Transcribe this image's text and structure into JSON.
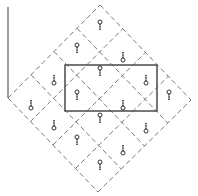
{
  "diagram": {
    "width": 198,
    "height": 196,
    "colors": {
      "background": "#ffffff",
      "dashed_grid": "#7a7a7a",
      "solid_rect": "#4a4a4a",
      "axis_line": "#6a6a6a",
      "symbol": "#333333"
    },
    "axis_line": {
      "x": 8,
      "y1": 7,
      "y2": 98
    },
    "diamond": {
      "top": [
        100,
        5
      ],
      "right": [
        191,
        100
      ],
      "bottom": [
        98,
        192
      ],
      "left": [
        8,
        98
      ],
      "divisions": 4
    },
    "rectangle": {
      "x": 65,
      "y": 65,
      "width": 92,
      "height": 46
    },
    "symbols": [
      {
        "x": 100,
        "y": 25,
        "type": "circle-top"
      },
      {
        "x": 77,
        "y": 48,
        "type": "circle-top"
      },
      {
        "x": 123,
        "y": 57,
        "type": "circle-bottom"
      },
      {
        "x": 54,
        "y": 80,
        "type": "circle-bottom"
      },
      {
        "x": 100,
        "y": 71,
        "type": "circle-top"
      },
      {
        "x": 146,
        "y": 80,
        "type": "circle-bottom"
      },
      {
        "x": 31,
        "y": 105,
        "type": "circle-bottom"
      },
      {
        "x": 77,
        "y": 95,
        "type": "circle-top"
      },
      {
        "x": 123,
        "y": 105,
        "type": "circle-bottom"
      },
      {
        "x": 169,
        "y": 95,
        "type": "circle-top"
      },
      {
        "x": 54,
        "y": 125,
        "type": "circle-bottom"
      },
      {
        "x": 100,
        "y": 118,
        "type": "circle-top"
      },
      {
        "x": 146,
        "y": 128,
        "type": "circle-bottom"
      },
      {
        "x": 77,
        "y": 140,
        "type": "circle-top"
      },
      {
        "x": 123,
        "y": 150,
        "type": "circle-bottom"
      },
      {
        "x": 100,
        "y": 165,
        "type": "circle-top"
      }
    ]
  }
}
